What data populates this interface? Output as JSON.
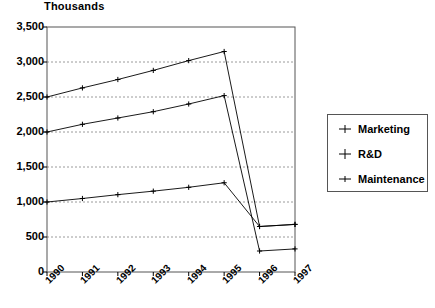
{
  "chart_data": {
    "type": "line",
    "title": "",
    "ylabel": "Thousands",
    "xlabel": "",
    "categories": [
      "1990",
      "1991",
      "1992",
      "1993",
      "1994",
      "1995",
      "1996",
      "1997"
    ],
    "ylim": [
      0,
      3500
    ],
    "ytick_labels": [
      "0",
      "500",
      "1,000",
      "1,500",
      "2,000",
      "2,500",
      "3,000",
      "3,500"
    ],
    "ytick_values": [
      0,
      500,
      1000,
      1500,
      2000,
      2500,
      3000,
      3500
    ],
    "grid": "horizontal-dashed",
    "legend_position": "right-outside",
    "series": [
      {
        "name": "Marketing",
        "marker": "plus",
        "values": [
          2500,
          2630,
          2750,
          2880,
          3020,
          3150,
          650,
          680
        ]
      },
      {
        "name": "R&D",
        "marker": "plus",
        "values": [
          2000,
          2110,
          2200,
          2290,
          2400,
          2520,
          300,
          330
        ]
      },
      {
        "name": "Maintenance",
        "marker": "plus",
        "values": [
          1000,
          1050,
          1105,
          1155,
          1210,
          1275,
          650,
          680
        ]
      }
    ]
  },
  "legend": {
    "items": [
      {
        "label": "Marketing",
        "marker_name": "marker-plus-marketing"
      },
      {
        "label": "R&D",
        "marker_name": "marker-plus-rd"
      },
      {
        "label": "Maintenance",
        "marker_name": "marker-plus-maintenance"
      }
    ]
  },
  "colors": {
    "line": "#000000",
    "grid": "#808080",
    "frame": "#555555",
    "background": "#ffffff"
  }
}
